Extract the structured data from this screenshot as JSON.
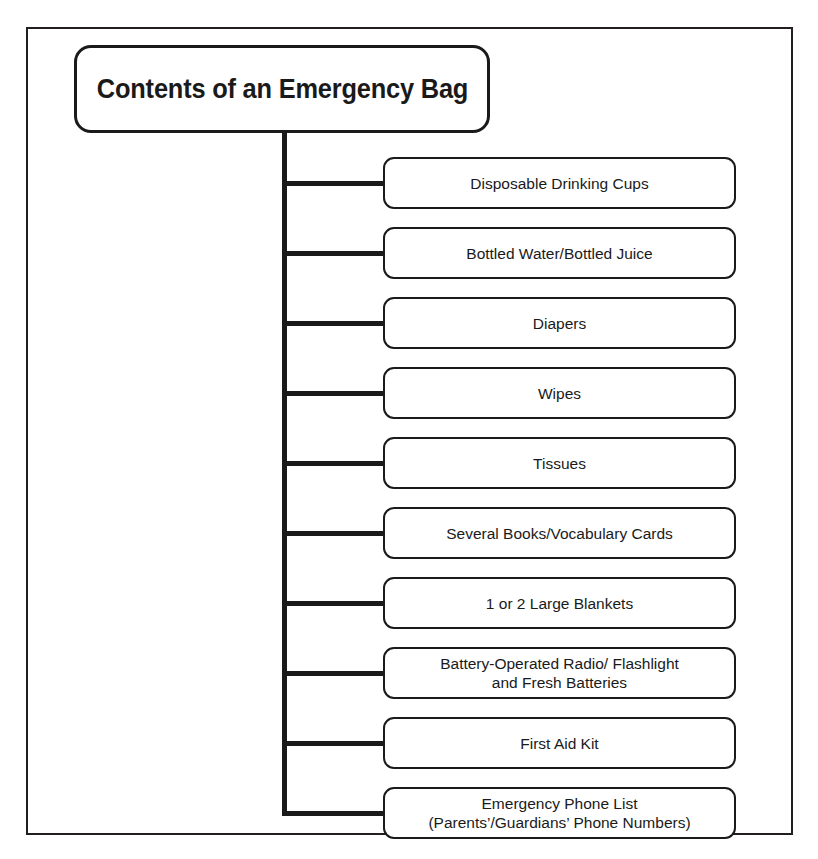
{
  "diagram": {
    "kind": "tree-diagram",
    "title": "Contents of an Emergency Bag",
    "root": {
      "label": "Contents of an Emergency Bag"
    },
    "colors": {
      "line": "#1a1a1a",
      "frame": "#231f20",
      "background": "#ffffff",
      "text": "#1a1a1a"
    },
    "children": [
      {
        "label": "Disposable Drinking Cups"
      },
      {
        "label": "Bottled Water/Bottled Juice"
      },
      {
        "label": "Diapers"
      },
      {
        "label": "Wipes"
      },
      {
        "label": "Tissues"
      },
      {
        "label": "Several Books/Vocabulary Cards"
      },
      {
        "label": "1 or 2 Large Blankets"
      },
      {
        "label": "Battery-Operated Radio/ Flashlight\nand Fresh Batteries"
      },
      {
        "label": "First Aid Kit"
      },
      {
        "label": "Emergency Phone List\n(Parents’/Guardians’ Phone Numbers)"
      }
    ]
  },
  "layout": {
    "child_first_top": 157,
    "child_pitch": 70,
    "child_height": 52,
    "trunk_left": 282,
    "trunk_top": 130,
    "connector_width": 101
  }
}
